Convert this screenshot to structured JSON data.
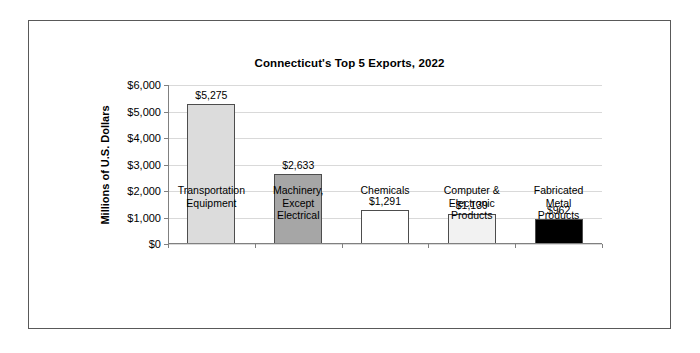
{
  "figure": {
    "title": "Connecticut's Top 5 Exports, 2022",
    "y_axis_title": "Millions of U.S. Dollars"
  },
  "chart_data": {
    "type": "bar",
    "title": "Connecticut's Top 5 Exports, 2022",
    "xlabel": "",
    "ylabel": "Millions of U.S. Dollars",
    "ylim": [
      0,
      6000
    ],
    "ytick_values": [
      0,
      1000,
      2000,
      3000,
      4000,
      5000,
      6000
    ],
    "ytick_labels": [
      "$0",
      "$1,000",
      "$2,000",
      "$3,000",
      "$4,000",
      "$5,000",
      "$6,000"
    ],
    "grid": true,
    "legend": false,
    "categories": [
      "Transportation\nEquipment",
      "Machinery,\nExcept\nElectrical",
      "Chemicals",
      "Computer &\nElectronic\nProducts",
      "Fabricated\nMetal\nProducts"
    ],
    "values": [
      5275,
      2633,
      1291,
      1139,
      962
    ],
    "value_labels": [
      "$5,275",
      "$2,633",
      "$1,291",
      "$1,139",
      "$962"
    ],
    "bar_colors": [
      "#dcdcdc",
      "#a6a6a6",
      "#ffffff",
      "#f2f2f2",
      "#000000"
    ],
    "bar_edge_color": "#4d4d4d"
  },
  "colors": {
    "frame_border": "#595959",
    "gridline": "#d9d9d9",
    "axis": "#808080",
    "text": "#000000"
  }
}
